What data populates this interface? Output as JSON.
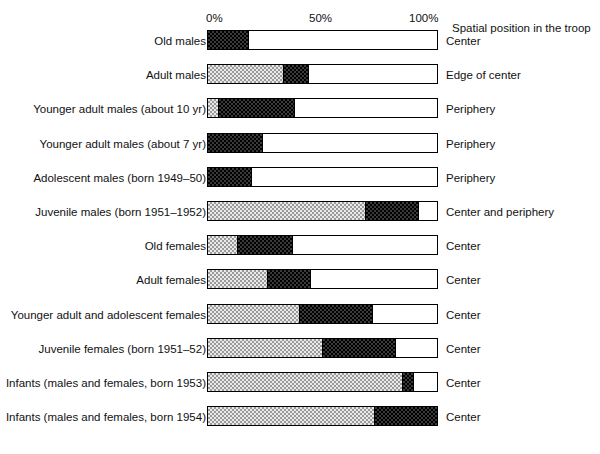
{
  "chart_data": {
    "type": "bar",
    "subtype": "stacked-horizontal-percent",
    "title": "",
    "xlabel": "",
    "ylabel": "",
    "xlim": [
      0,
      100
    ],
    "grid": false,
    "legend_position": "right",
    "axis_ticks": [
      "0%",
      "50%",
      "100%"
    ],
    "axis_tick_values": [
      0,
      50,
      100
    ],
    "right_column_header": "Spatial position in the troop",
    "series": [
      {
        "name": "dark",
        "fill": "dark-checker"
      },
      {
        "name": "light",
        "fill": "light-checker"
      },
      {
        "name": "white",
        "fill": "empty"
      }
    ],
    "categories": [
      "Old males",
      "Adult males",
      "Younger adult males (about 10 yr)",
      "Younger adult males (about 7 yr)",
      "Adolescent males (born 1949–50)",
      "Juvenile males (born 1951–1952)",
      "Old females",
      "Adult females",
      "Younger adult and adolescent females",
      "Juvenile females (born 1951–52)",
      "Infants (males and females, born 1953)",
      "Infants (males and females, born 1954)"
    ],
    "rows": [
      {
        "label": "Old males",
        "position": "Center",
        "segments": [
          {
            "fill": "dark",
            "value": 18
          },
          {
            "fill": "white",
            "value": 82
          }
        ]
      },
      {
        "label": "Adult males",
        "position": "Edge of center",
        "segments": [
          {
            "fill": "light",
            "value": 33
          },
          {
            "fill": "dark",
            "value": 11
          },
          {
            "fill": "white",
            "value": 56
          }
        ]
      },
      {
        "label": "Younger adult males (about 10 yr)",
        "position": "Periphery",
        "segments": [
          {
            "fill": "light",
            "value": 5
          },
          {
            "fill": "dark",
            "value": 33
          },
          {
            "fill": "white",
            "value": 62
          }
        ]
      },
      {
        "label": "Younger adult males (about 7 yr)",
        "position": "Periphery",
        "segments": [
          {
            "fill": "dark",
            "value": 24
          },
          {
            "fill": "white",
            "value": 76
          }
        ]
      },
      {
        "label": "Adolescent males (born 1949–50)",
        "position": "Periphery",
        "segments": [
          {
            "fill": "dark",
            "value": 19
          },
          {
            "fill": "white",
            "value": 81
          }
        ]
      },
      {
        "label": "Juvenile males (born 1951–1952)",
        "position": "Center and periphery",
        "segments": [
          {
            "fill": "light",
            "value": 69
          },
          {
            "fill": "dark",
            "value": 23
          },
          {
            "fill": "white",
            "value": 8
          }
        ]
      },
      {
        "label": "Old females",
        "position": "Center",
        "segments": [
          {
            "fill": "light",
            "value": 13
          },
          {
            "fill": "dark",
            "value": 24
          },
          {
            "fill": "white",
            "value": 63
          }
        ]
      },
      {
        "label": "Adult females",
        "position": "Center",
        "segments": [
          {
            "fill": "light",
            "value": 26
          },
          {
            "fill": "dark",
            "value": 19
          },
          {
            "fill": "white",
            "value": 55
          }
        ]
      },
      {
        "label": "Younger adult and adolescent females",
        "position": "Center",
        "segments": [
          {
            "fill": "light",
            "value": 40
          },
          {
            "fill": "dark",
            "value": 32
          },
          {
            "fill": "white",
            "value": 28
          }
        ]
      },
      {
        "label": "Juvenile females (born 1951–52)",
        "position": "Center",
        "segments": [
          {
            "fill": "light",
            "value": 50
          },
          {
            "fill": "dark",
            "value": 32
          },
          {
            "fill": "white",
            "value": 18
          }
        ]
      },
      {
        "label": "Infants (males and females, born 1953)",
        "position": "Center",
        "segments": [
          {
            "fill": "light",
            "value": 85
          },
          {
            "fill": "dark",
            "value": 5
          },
          {
            "fill": "white",
            "value": 10
          }
        ]
      },
      {
        "label": "Infants (males and females, born 1954)",
        "position": "Center",
        "segments": [
          {
            "fill": "light",
            "value": 73
          },
          {
            "fill": "dark",
            "value": 27
          }
        ]
      }
    ]
  },
  "colors": {
    "dark": "#3a3a3a",
    "light": "#e9e9e9",
    "white": "#ffffff",
    "outline": "#000000",
    "text": "#111111"
  }
}
